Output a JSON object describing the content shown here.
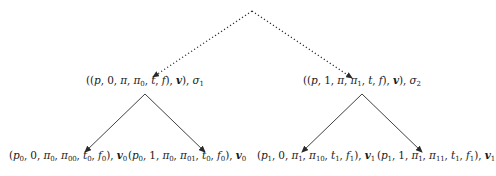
{
  "diagram": {
    "type": "tree",
    "root": {
      "id": "root",
      "label": "",
      "x": 252,
      "y": 11
    },
    "level1": [
      {
        "id": "n1",
        "label": "((p, 0, π, π0, t, f), v), σ1",
        "parts": [
          {
            "t": "((",
            "s": ""
          },
          {
            "t": "p",
            "s": ""
          },
          {
            "t": ", 0, ",
            "s": ""
          },
          {
            "t": "π",
            "s": ""
          },
          {
            "t": ", ",
            "s": ""
          },
          {
            "t": "π",
            "s": "0"
          },
          {
            "t": ", ",
            "s": ""
          },
          {
            "t": "t",
            "s": ""
          },
          {
            "t": ", ",
            "s": ""
          },
          {
            "t": "f",
            "s": ""
          },
          {
            "t": "), ",
            "s": ""
          },
          {
            "t": "v",
            "s": ""
          },
          {
            "t": "), ",
            "s": ""
          },
          {
            "t": "σ",
            "s": "1"
          }
        ],
        "x": 145,
        "y": 80,
        "edge_from_root": "dotted"
      },
      {
        "id": "n2",
        "label": "((p, 1, π, π1, t, f), v), σ2",
        "parts": [
          {
            "t": "((",
            "s": ""
          },
          {
            "t": "p",
            "s": ""
          },
          {
            "t": ", 1, ",
            "s": ""
          },
          {
            "t": "π",
            "s": ""
          },
          {
            "t": ", ",
            "s": ""
          },
          {
            "t": "π",
            "s": "1"
          },
          {
            "t": ", ",
            "s": ""
          },
          {
            "t": "t",
            "s": ""
          },
          {
            "t": ", ",
            "s": ""
          },
          {
            "t": "f",
            "s": ""
          },
          {
            "t": "), ",
            "s": ""
          },
          {
            "t": "v",
            "s": ""
          },
          {
            "t": "), ",
            "s": ""
          },
          {
            "t": "σ",
            "s": "2"
          }
        ],
        "x": 362,
        "y": 80,
        "edge_from_root": "dotted"
      }
    ],
    "level2": [
      {
        "id": "n10",
        "parent": "n1",
        "label": "(p0, 0, π0, π00, t0, f0), v0",
        "parts": [
          {
            "t": "(",
            "s": ""
          },
          {
            "t": "p",
            "s": "0"
          },
          {
            "t": ", 0, ",
            "s": ""
          },
          {
            "t": "π",
            "s": "0"
          },
          {
            "t": ", ",
            "s": ""
          },
          {
            "t": "π",
            "s": "00"
          },
          {
            "t": ", ",
            "s": ""
          },
          {
            "t": "t",
            "s": "0"
          },
          {
            "t": ", ",
            "s": ""
          },
          {
            "t": "f",
            "s": "0"
          },
          {
            "t": "), ",
            "s": ""
          },
          {
            "t": "v",
            "s": "0"
          }
        ],
        "x": 68,
        "y": 155,
        "edge": "solid"
      },
      {
        "id": "n11",
        "parent": "n1",
        "label": "(p0, 1, π0, π01, t0, f0), v0",
        "parts": [
          {
            "t": "(",
            "s": ""
          },
          {
            "t": "p",
            "s": "0"
          },
          {
            "t": ", 1, ",
            "s": ""
          },
          {
            "t": "π",
            "s": "0"
          },
          {
            "t": ", ",
            "s": ""
          },
          {
            "t": "π",
            "s": "01"
          },
          {
            "t": ", ",
            "s": ""
          },
          {
            "t": "t",
            "s": "0"
          },
          {
            "t": ", ",
            "s": ""
          },
          {
            "t": "f",
            "s": "0"
          },
          {
            "t": "), ",
            "s": ""
          },
          {
            "t": "v",
            "s": "0"
          }
        ],
        "x": 187,
        "y": 155,
        "edge": "solid"
      },
      {
        "id": "n20",
        "parent": "n2",
        "label": "(p1, 0, π1, π10, t1, f1), v1",
        "parts": [
          {
            "t": "(",
            "s": ""
          },
          {
            "t": "p",
            "s": "1"
          },
          {
            "t": ", 0, ",
            "s": ""
          },
          {
            "t": "π",
            "s": "1"
          },
          {
            "t": ", ",
            "s": ""
          },
          {
            "t": "π",
            "s": "10"
          },
          {
            "t": ", ",
            "s": ""
          },
          {
            "t": "t",
            "s": "1"
          },
          {
            "t": ", ",
            "s": ""
          },
          {
            "t": "f",
            "s": "1"
          },
          {
            "t": "), ",
            "s": ""
          },
          {
            "t": "v",
            "s": "1"
          }
        ],
        "x": 316,
        "y": 155,
        "edge": "solid"
      },
      {
        "id": "n21",
        "parent": "n2",
        "label": "(p1, 1, π1, π11, t1, f1), v1",
        "parts": [
          {
            "t": "(",
            "s": ""
          },
          {
            "t": "p",
            "s": "1"
          },
          {
            "t": ", 1, ",
            "s": ""
          },
          {
            "t": "π",
            "s": "1"
          },
          {
            "t": ", ",
            "s": ""
          },
          {
            "t": "π",
            "s": "11"
          },
          {
            "t": ", ",
            "s": ""
          },
          {
            "t": "t",
            "s": "1"
          },
          {
            "t": ", ",
            "s": ""
          },
          {
            "t": "f",
            "s": "1"
          },
          {
            "t": "), ",
            "s": ""
          },
          {
            "t": "v",
            "s": "1"
          }
        ],
        "x": 436,
        "y": 155,
        "edge": "solid"
      }
    ],
    "edges": [
      {
        "from": [
          252,
          11
        ],
        "to": [
          153,
          77
        ],
        "style": "dotted",
        "arrow": true
      },
      {
        "from": [
          252,
          11
        ],
        "to": [
          352,
          78
        ],
        "style": "dotted",
        "arrow": true
      },
      {
        "from": [
          145,
          94
        ],
        "to": [
          85,
          152
        ],
        "style": "solid",
        "arrow": true
      },
      {
        "from": [
          145,
          94
        ],
        "to": [
          205,
          152
        ],
        "style": "solid",
        "arrow": true
      },
      {
        "from": [
          362,
          94
        ],
        "to": [
          302,
          152
        ],
        "style": "solid",
        "arrow": true
      },
      {
        "from": [
          362,
          94
        ],
        "to": [
          422,
          152
        ],
        "style": "solid",
        "arrow": true
      }
    ],
    "colors": {
      "line": "#2a2a2a",
      "text": "#1a1a1a",
      "background": "#ffffff"
    }
  }
}
